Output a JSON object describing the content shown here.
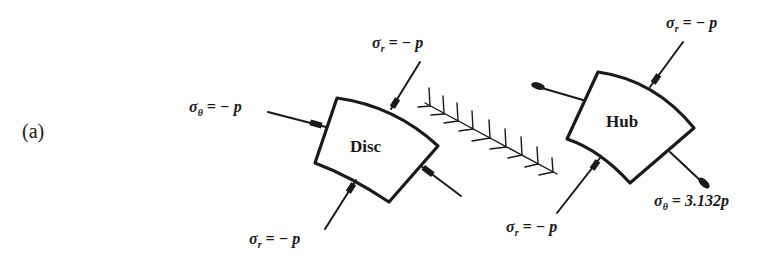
{
  "figure": {
    "part_label": "(a)",
    "disc": {
      "name": "Disc",
      "labels": {
        "sigma_r_top": {
          "sym": "σ",
          "sub": "r",
          "rhs": "= − p"
        },
        "sigma_theta_left": {
          "sym": "σ",
          "sub": "θ",
          "rhs": "= − p"
        },
        "sigma_r_bottom": {
          "sym": "σ",
          "sub": "r",
          "rhs": "= − p"
        }
      }
    },
    "hub": {
      "name": "Hub",
      "labels": {
        "sigma_r_top": {
          "sym": "σ",
          "sub": "r",
          "rhs": "= − p"
        },
        "sigma_r_bottom": {
          "sym": "σ",
          "sub": "r",
          "rhs": "= − p"
        },
        "sigma_theta_right": {
          "sym": "σ",
          "sub": "θ",
          "rhs": "= 3.132p"
        }
      }
    },
    "interface_symbol": "hatched-cut-line",
    "ink_color": "#1a1a1a"
  }
}
